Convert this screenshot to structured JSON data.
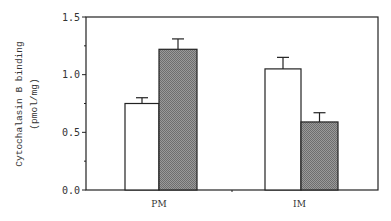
{
  "chart_data": {
    "type": "bar",
    "title": "",
    "xlabel": "",
    "ylabel": "Cytochalasin B binding",
    "ylabel_unit": "(pmol/mg)",
    "ylim": [
      0,
      1.5
    ],
    "yticks": [
      "0.0",
      "0.5",
      "1.0",
      "1.5"
    ],
    "categories": [
      "PM",
      "IM"
    ],
    "grid": false,
    "legend": null,
    "series": [
      {
        "name": "open (white) bars",
        "fill": "#ffffff",
        "values": [
          0.75,
          1.05
        ],
        "errors": [
          0.05,
          0.1
        ]
      },
      {
        "name": "hatched (gray) bars",
        "fill": "#8a8a8a",
        "values": [
          1.22,
          0.59
        ],
        "errors": [
          0.09,
          0.08
        ]
      }
    ]
  }
}
